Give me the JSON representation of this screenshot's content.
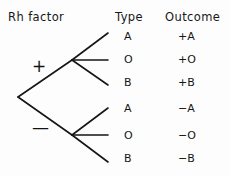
{
  "diagram": {
    "title_columns": {
      "rh_factor": "Rh factor",
      "type": "Type",
      "outcome": "Outcome"
    },
    "root": {
      "x": 18,
      "y": 97
    },
    "branches": [
      {
        "sign_label": "+",
        "sign_x": 38,
        "sign_y": 67,
        "node_x": 72,
        "node_y": 60,
        "leaves": [
          {
            "type": "A",
            "outcome": "+A",
            "end_x": 108,
            "end_y": 33
          },
          {
            "type": "O",
            "outcome": "+O",
            "end_x": 108,
            "end_y": 60
          },
          {
            "type": "B",
            "outcome": "+B",
            "end_x": 108,
            "end_y": 85
          }
        ]
      },
      {
        "sign_label": "—",
        "sign_x": 40,
        "sign_y": 129,
        "node_x": 72,
        "node_y": 135,
        "leaves": [
          {
            "type": "A",
            "outcome": "−A",
            "end_x": 108,
            "end_y": 108
          },
          {
            "type": "O",
            "outcome": "−O",
            "end_x": 108,
            "end_y": 135
          },
          {
            "type": "B",
            "outcome": "−B",
            "end_x": 108,
            "end_y": 162
          }
        ]
      }
    ],
    "rows": [
      {
        "type": "A",
        "outcome": "+A"
      },
      {
        "type": "O",
        "outcome": "+O"
      },
      {
        "type": "B",
        "outcome": "+B"
      },
      {
        "type": "A",
        "outcome": "−A"
      },
      {
        "type": "O",
        "outcome": "−O"
      },
      {
        "type": "B",
        "outcome": "−B"
      }
    ],
    "colors": {
      "ink": "#151515",
      "background": "#fdfdfd"
    }
  }
}
